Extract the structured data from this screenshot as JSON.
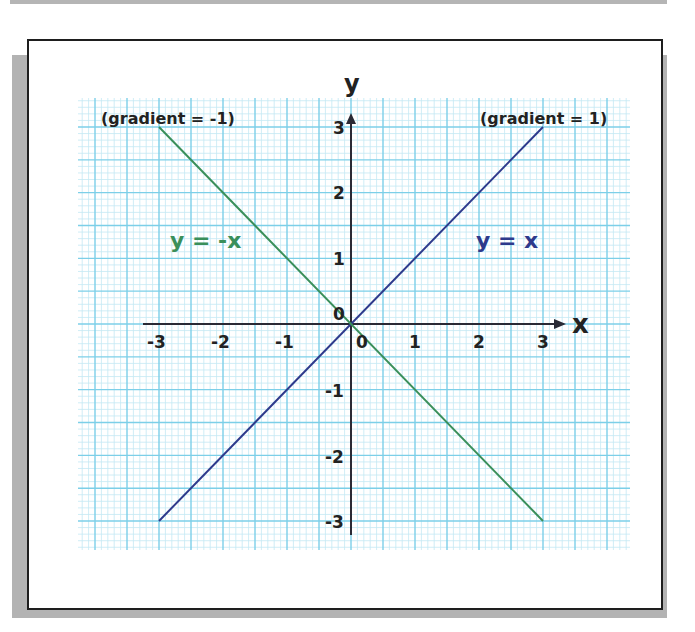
{
  "chart_data": {
    "type": "line",
    "title": "",
    "xlabel": "x",
    "ylabel": "y",
    "xlim": [
      -3,
      3
    ],
    "ylim": [
      -3,
      3
    ],
    "grid": true,
    "x_ticks": [
      "-3",
      "-2",
      "-1",
      "0",
      "1",
      "2",
      "3"
    ],
    "y_ticks": [
      "-3",
      "-2",
      "-1",
      "0",
      "1",
      "2",
      "3"
    ],
    "series": [
      {
        "name": "y = x",
        "color": "#2e3a8c",
        "x": [
          -3,
          3
        ],
        "y": [
          -3,
          3
        ],
        "gradient_label": "(gradient = 1)"
      },
      {
        "name": "y = -x",
        "color": "#3a8f5a",
        "x": [
          -3,
          3
        ],
        "y": [
          3,
          -3
        ],
        "gradient_label": "(gradient = -1)"
      }
    ],
    "annotations": [
      {
        "text": "(gradient = -1)",
        "position": "top-left"
      },
      {
        "text": "(gradient = 1)",
        "position": "top-right"
      },
      {
        "text": "y = -x",
        "position": "upper-left",
        "color": "#3a8f5a"
      },
      {
        "text": "y = x",
        "position": "upper-right",
        "color": "#2e3a8c"
      }
    ]
  },
  "labels": {
    "x_axis": "x",
    "y_axis": "y",
    "origin_x": "0",
    "origin_y": "0",
    "grad_neg": "(gradient = -1)",
    "grad_pos": "(gradient = 1)",
    "eq_neg": "y = -x",
    "eq_pos": "y = x",
    "xt": [
      "-3",
      "-2",
      "-1",
      "1",
      "2",
      "3"
    ],
    "yt": [
      "3",
      "2",
      "1",
      "-1",
      "-2",
      "-3"
    ]
  },
  "colors": {
    "grid_major": "#7ccfe8",
    "grid_minor": "#c4e9f4",
    "axis": "#2a2a35",
    "line_pos": "#2e3a8c",
    "line_neg": "#3a8f5a"
  }
}
